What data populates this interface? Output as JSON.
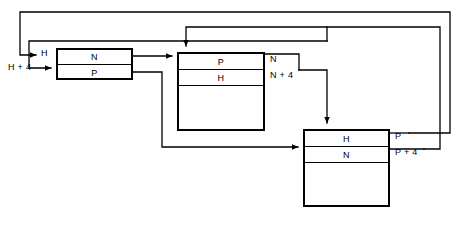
{
  "diagram": {
    "stroke_color": "#000000",
    "background": "#ffffff",
    "blocks": [
      {
        "name": "left-block",
        "x": 56,
        "y": 48,
        "w": 77,
        "h": 32,
        "rows": [
          {
            "label": "N",
            "h": 15,
            "divider": true
          },
          {
            "label": "P",
            "h": 15,
            "divider": false
          }
        ]
      },
      {
        "name": "middle-block",
        "x": 177,
        "y": 52,
        "w": 88,
        "h": 79,
        "rows": [
          {
            "label": "P",
            "h": 16,
            "divider": true
          },
          {
            "label": "H",
            "h": 16,
            "divider": true
          },
          {
            "label": "",
            "h": 45,
            "divider": false
          }
        ]
      },
      {
        "name": "right-block",
        "x": 303,
        "y": 129,
        "w": 87,
        "h": 78,
        "rows": [
          {
            "label": "H",
            "h": 16,
            "divider": true
          },
          {
            "label": "N",
            "h": 16,
            "divider": true
          },
          {
            "label": "",
            "h": 44,
            "divider": false
          }
        ]
      }
    ],
    "labels": [
      {
        "name": "label-h",
        "text": "H",
        "x": 41,
        "y": 48
      },
      {
        "name": "label-h-plus-4",
        "text": "H + 4",
        "x": 8,
        "y": 62
      },
      {
        "name": "label-n",
        "text": "N",
        "x": 270,
        "y": 54
      },
      {
        "name": "label-n-plus-4",
        "text": "N + 4",
        "x": 270,
        "y": 70
      },
      {
        "name": "label-p",
        "text": "P",
        "x": 395,
        "y": 131
      },
      {
        "name": "label-p-plus-4",
        "text": "P + 4",
        "x": 395,
        "y": 147
      }
    ]
  }
}
